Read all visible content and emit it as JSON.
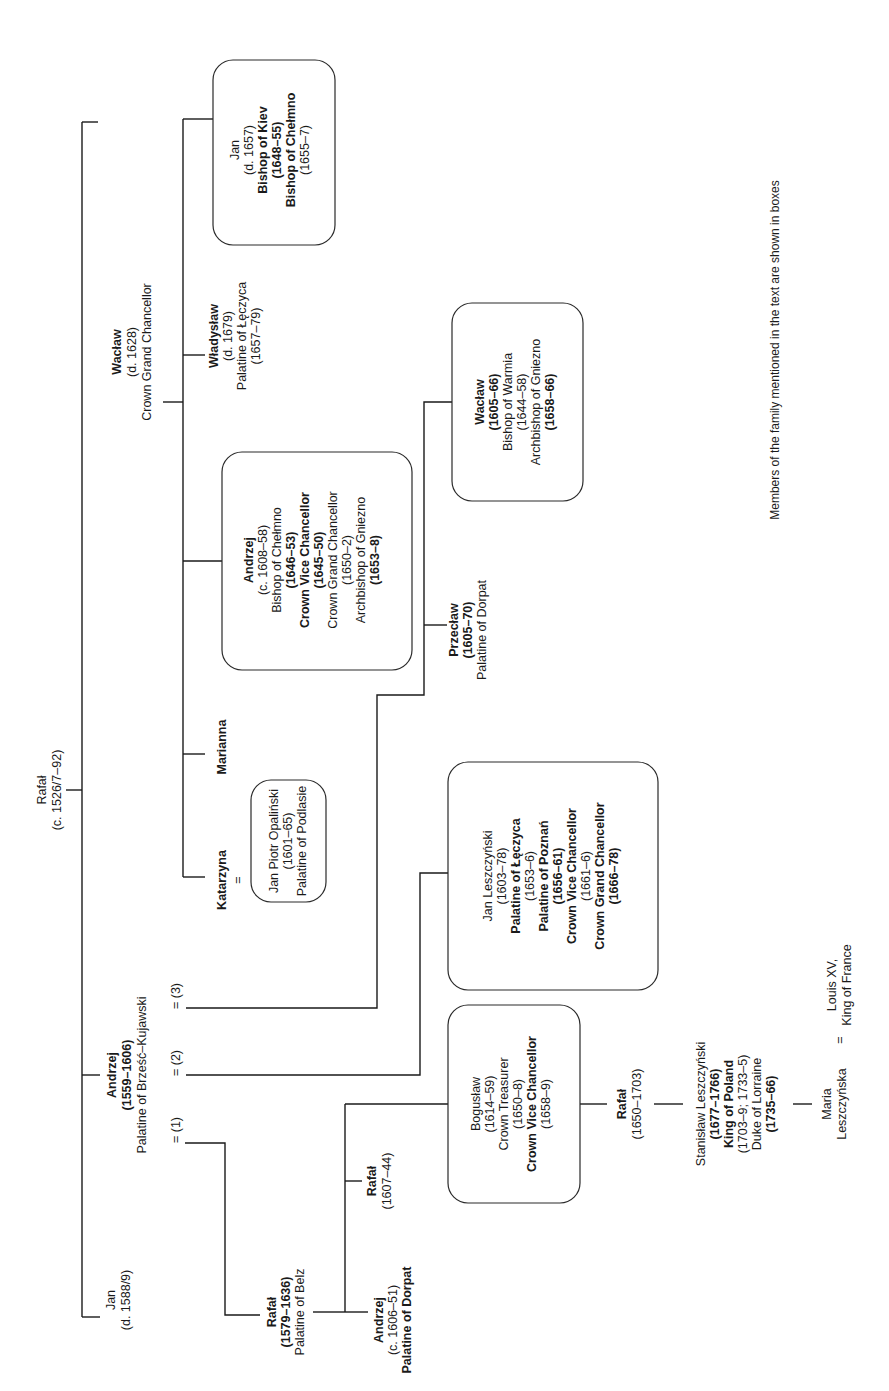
{
  "caption": "Members of the family mentioned in the text are shown in boxes",
  "people": {
    "rafal_root": {
      "lines": [
        "Rafał",
        "(c. 1526/7–92)"
      ],
      "boxed": false
    },
    "jan_1588": {
      "lines": [
        "Jan",
        "(d. 1588/9)"
      ],
      "boxed": false
    },
    "andrzej_1559": {
      "lines": [
        "Andrzej",
        "(1559–1606)",
        "Palatine of Brześć–Kujawski"
      ],
      "boxed": false
    },
    "waclaw_1628": {
      "lines": [
        "Wacław",
        "(d. 1628)",
        "Crown Grand Chancellor"
      ],
      "boxed": false
    },
    "katarzyna": {
      "lines": [
        "Katarzyna"
      ],
      "boxed": false
    },
    "jan_piotr": {
      "lines": [
        "Jan Piotr Opaliński",
        "(1601–65)",
        "Palatine of Podlasie"
      ],
      "boxed": true
    },
    "marianna": {
      "lines": [
        "Marianna"
      ],
      "boxed": false
    },
    "andrzej_1608": {
      "lines": [
        "Andrzej",
        "(c. 1608–58)",
        "Bishop of Chełmno",
        "(1646–53)",
        "Crown Vice Chancellor",
        "(1645–50)",
        "Crown Grand Chancellor",
        "(1650–2)",
        "Archbishop of Gniezno",
        "(1653–8)"
      ],
      "boxed": true
    },
    "wladyslaw": {
      "lines": [
        "Władysław",
        "(d. 1679)",
        "Palatine of Łęczyca",
        "(1657–79)"
      ],
      "boxed": false
    },
    "jan_1657": {
      "lines": [
        "Jan",
        "(d. 1657)",
        "Bishop of Kiev",
        "(1648–55)",
        "Bishop of Chełmno",
        "(1655–7)"
      ],
      "boxed": true
    },
    "rafal_1579": {
      "lines": [
        "Rafał",
        "(1579–1636)",
        "Palatine of Belz"
      ],
      "boxed": false
    },
    "andrzej_1606": {
      "lines": [
        "Andrzej",
        "(c. 1606–51)",
        "Palatine of Dorpat"
      ],
      "boxed": false
    },
    "rafal_1607": {
      "lines": [
        "Rafał",
        "(1607–44)"
      ],
      "boxed": false
    },
    "boguslaw": {
      "lines": [
        "Bogusław",
        "(1614–59)",
        "Crown Treasurer",
        "(1650–8)",
        "Crown Vice Chancellor",
        "(1658–9)"
      ],
      "boxed": true
    },
    "jan_leszczynski": {
      "lines": [
        "Jan Leszczyński",
        "(1603–78)",
        "Palatine of Łęczyca",
        "(1653–6)",
        "Palatine of Poznań",
        "(1656–61)",
        "Crown Vice Chancellor",
        "(1661–6)",
        "Crown Grand Chancellor",
        "(1666–78)"
      ],
      "boxed": true
    },
    "przeclaw": {
      "lines": [
        "Przecław",
        "(1605–70)",
        "Palatine of Dorpat"
      ],
      "boxed": false
    },
    "waclaw_1605": {
      "lines": [
        "Wacław",
        "(1605–66)",
        "Bishop of Warmia",
        "(1644–58)",
        "Archbishop of Gniezno",
        "(1658–66)"
      ],
      "boxed": true
    },
    "rafal_1650": {
      "lines": [
        "Rafał",
        "(1650–1703)"
      ],
      "boxed": false
    },
    "stanislaw": {
      "lines": [
        "Stanisław Leszczyński",
        "(1677–1766)",
        "King of Poland",
        "(1703–9; 1733–5)",
        "Duke of Lorraine",
        "(1735–66)"
      ],
      "boxed": false
    },
    "maria": {
      "lines": [
        "Maria",
        "Leszczyńska"
      ],
      "boxed": false
    },
    "louis": {
      "lines": [
        "Louis XV,",
        "King of France"
      ],
      "boxed": false
    }
  },
  "marriage_labels": {
    "m1": "= (1)",
    "m2": "= (2)",
    "m3": "= (3)",
    "katarzyna_eq": "=",
    "maria_eq": "="
  }
}
